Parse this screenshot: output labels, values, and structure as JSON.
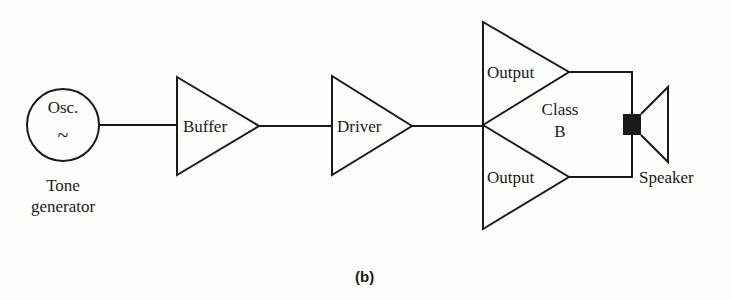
{
  "diagram": {
    "caption": "(b)",
    "blocks": {
      "oscillator": {
        "label": "Osc.",
        "symbol": "~",
        "caption_line1": "Tone",
        "caption_line2": "generator"
      },
      "buffer": {
        "label": "Buffer"
      },
      "driver": {
        "label": "Driver"
      },
      "output_top": {
        "label": "Output"
      },
      "output_bottom": {
        "label": "Output"
      },
      "class_b": {
        "line1": "Class",
        "line2": "B"
      },
      "speaker": {
        "label": "Speaker"
      }
    },
    "connections": [
      {
        "from": "Osc.",
        "to": "Buffer"
      },
      {
        "from": "Buffer",
        "to": "Driver"
      },
      {
        "from": "Driver",
        "to": "Output (top)"
      },
      {
        "from": "Driver",
        "to": "Output (bottom)"
      },
      {
        "from": "Output (top)",
        "to": "Speaker"
      },
      {
        "from": "Output (bottom)",
        "to": "Speaker"
      }
    ],
    "colors": {
      "line": "#1a1a1a",
      "background": "#fdfdfb"
    }
  }
}
